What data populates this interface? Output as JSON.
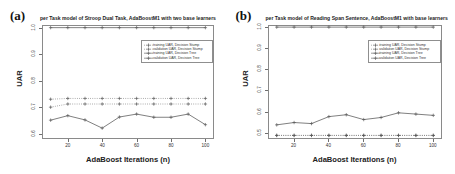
{
  "figure": {
    "panels": [
      {
        "letter": "(a)",
        "title": "per Task model of Stroop Dual Task, AdaBoostM1 with two base learners",
        "xlabel": "AdaBoost Iterations (n)",
        "ylabel": "UAR"
      },
      {
        "letter": "(b)",
        "title": "per Task model of Reading Span Sentence, AdaBoostM1 with base learners",
        "xlabel": "AdaBoost Iterations (n)",
        "ylabel": "UAR"
      }
    ],
    "legend_labels": [
      "training UAR, Decision Stump",
      "validation UAR, Decision Stump",
      "training UAR, Decision Tree",
      "validation UAR, Decision Tree"
    ]
  },
  "colors": {
    "line": "#555555",
    "axis": "#8a8a8a",
    "text": "#222222",
    "background": "#ffffff"
  },
  "chart_data": [
    {
      "type": "line",
      "panel": "(a)",
      "title": "per Task model of Stroop Dual Task, AdaBoostM1 with two base learners",
      "xlabel": "AdaBoost Iterations (n)",
      "ylabel": "UAR",
      "x": [
        10,
        20,
        30,
        40,
        50,
        60,
        70,
        80,
        90,
        100
      ],
      "xlim": [
        5,
        105
      ],
      "ylim": [
        0.58,
        1.01
      ],
      "xticks": [
        20,
        40,
        60,
        80,
        100
      ],
      "yticks": [
        0.6,
        0.7,
        0.8,
        0.9,
        1.0
      ],
      "ytick_labels": [
        "0.6",
        "0.7",
        "0.8",
        "0.9",
        "1.0"
      ],
      "grid": false,
      "legend_position": "upper right",
      "series": [
        {
          "name": "training UAR, Decision Stump",
          "style": "dotted",
          "marker": "plus",
          "values": [
            0.73,
            0.733,
            0.733,
            0.733,
            0.733,
            0.733,
            0.733,
            0.733,
            0.733,
            0.733
          ]
        },
        {
          "name": "validation UAR, Decision Stump",
          "style": "dotted",
          "marker": "plus",
          "values": [
            0.7,
            0.712,
            0.712,
            0.712,
            0.712,
            0.712,
            0.712,
            0.712,
            0.712,
            0.712
          ]
        },
        {
          "name": "training UAR, Decision Tree",
          "style": "solid",
          "marker": "plus",
          "values": [
            1.0,
            1.0,
            1.0,
            1.0,
            1.0,
            1.0,
            1.0,
            1.0,
            1.0,
            1.0
          ]
        },
        {
          "name": "validation UAR, Decision Tree",
          "style": "solid",
          "marker": "plus",
          "values": [
            0.651,
            0.668,
            0.652,
            0.621,
            0.663,
            0.674,
            0.662,
            0.662,
            0.674,
            0.634
          ]
        }
      ]
    },
    {
      "type": "line",
      "panel": "(b)",
      "title": "per Task model of Reading Span Sentence, AdaBoostM1 with base learners",
      "xlabel": "AdaBoost Iterations (n)",
      "ylabel": "UAR",
      "x": [
        10,
        20,
        30,
        40,
        50,
        60,
        70,
        80,
        90,
        100
      ],
      "xlim": [
        5,
        105
      ],
      "ylim": [
        0.47,
        1.01
      ],
      "xticks": [
        20,
        40,
        60,
        80,
        100
      ],
      "yticks": [
        0.5,
        0.6,
        0.7,
        0.8,
        0.9,
        1.0
      ],
      "ytick_labels": [
        "0.5",
        "0.6",
        "0.7",
        "0.8",
        "0.9",
        "1.0"
      ],
      "grid": false,
      "legend_position": "upper right",
      "series": [
        {
          "name": "training UAR, Decision Stump",
          "style": "dotted",
          "marker": "plus",
          "values": [
            0.487,
            0.487,
            0.487,
            0.487,
            0.487,
            0.487,
            0.487,
            0.487,
            0.487,
            0.487
          ]
        },
        {
          "name": "validation UAR, Decision Stump",
          "style": "dotted",
          "marker": "plus",
          "values": [
            0.487,
            0.487,
            0.487,
            0.487,
            0.487,
            0.487,
            0.487,
            0.487,
            0.487,
            0.487
          ]
        },
        {
          "name": "training UAR, Decision Tree",
          "style": "solid",
          "marker": "plus",
          "values": [
            1.0,
            1.0,
            1.0,
            1.0,
            1.0,
            1.0,
            1.0,
            1.0,
            1.0,
            1.0
          ]
        },
        {
          "name": "validation UAR, Decision Tree",
          "style": "solid",
          "marker": "plus",
          "values": [
            0.537,
            0.548,
            0.543,
            0.576,
            0.585,
            0.562,
            0.572,
            0.594,
            0.588,
            0.582
          ]
        }
      ]
    }
  ]
}
